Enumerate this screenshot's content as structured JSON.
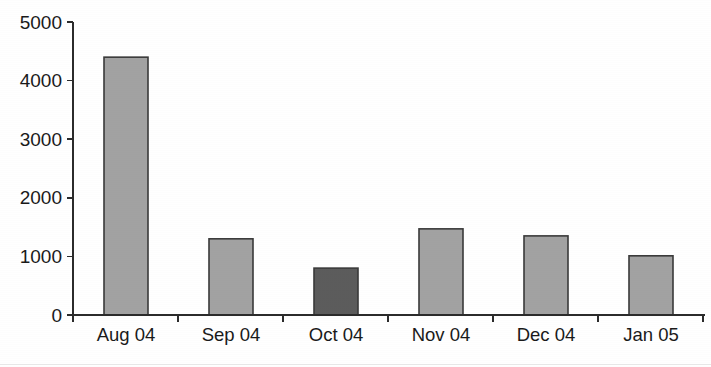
{
  "chart_data": {
    "type": "bar",
    "title": "",
    "subtitle": "",
    "xlabel": "",
    "ylabel": "",
    "categories": [
      "Aug 04",
      "Sep 04",
      "Oct 04",
      "Nov 04",
      "Dec 04",
      "Jan 05"
    ],
    "values": [
      4400,
      1300,
      800,
      1470,
      1350,
      1010
    ],
    "ylim": [
      0,
      5000
    ],
    "ytick_labels": [
      "0",
      "1000",
      "2000",
      "3000",
      "4000",
      "5000"
    ],
    "ytick_values": [
      0,
      1000,
      2000,
      3000,
      4000,
      5000
    ],
    "grid": false,
    "legend": false,
    "legend_position": "none",
    "bar_colors": [
      "#a2a2a2",
      "#a2a2a2",
      "#5c5c5c",
      "#a2a2a2",
      "#a2a2a2",
      "#a2a2a2"
    ],
    "highlighted_category": "Oct 04",
    "colors": {
      "bar_light": "#a2a2a2",
      "bar_dark": "#5c5c5c",
      "bar_border": "#3a3a3a",
      "axis": "#2b2b2b",
      "text": "#1a1a1a",
      "background": "#ffffff"
    }
  },
  "axes": {
    "y_axis_name": "y-axis",
    "x_axis_name": "x-axis"
  }
}
